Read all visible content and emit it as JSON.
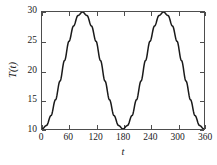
{
  "chart_data": {
    "type": "line",
    "title": "",
    "subtitle": "",
    "xlabel": "t",
    "ylabel": "T(t)",
    "xlim": [
      0,
      360
    ],
    "ylim": [
      10,
      30
    ],
    "xticks": [
      0,
      60,
      120,
      180,
      240,
      300,
      360
    ],
    "xticklabels": [
      "0",
      "60",
      "120",
      "180",
      "240",
      "300",
      "360"
    ],
    "yticks": [
      10,
      15,
      20,
      25,
      30
    ],
    "yticklabels": [
      "10",
      "15",
      "20",
      "25",
      "30"
    ],
    "grid": false,
    "legend": null,
    "frame": "box",
    "tick_direction": "in",
    "line_color": "#1a1a1a",
    "line_width": 1.5,
    "axis_color": "#4d4d4d",
    "background_color": "#ffffff",
    "series": [
      {
        "name": "T(t)",
        "formula": "T(t) = 20 - 10*cos(2t)",
        "x": [
          0,
          10,
          20,
          30,
          40,
          50,
          60,
          70,
          80,
          90,
          100,
          110,
          120,
          130,
          140,
          150,
          160,
          170,
          180,
          190,
          200,
          210,
          220,
          230,
          240,
          250,
          260,
          270,
          280,
          290,
          300,
          310,
          320,
          330,
          340,
          350,
          360
        ],
        "values": [
          10.0,
          10.6,
          12.3,
          15.0,
          18.2,
          21.7,
          25.0,
          27.6,
          29.4,
          30.0,
          29.4,
          27.6,
          25.0,
          21.7,
          18.2,
          15.0,
          12.3,
          10.6,
          10.0,
          10.6,
          12.3,
          15.0,
          18.2,
          21.7,
          25.0,
          27.6,
          29.4,
          30.0,
          29.4,
          27.6,
          25.0,
          21.7,
          18.2,
          15.0,
          12.3,
          10.6,
          10.0
        ]
      }
    ],
    "annotations": [
      {
        "label": "maximum",
        "x": 90,
        "y": 30
      },
      {
        "label": "maximum",
        "x": 270,
        "y": 30
      },
      {
        "label": "minimum",
        "x": 0,
        "y": 10
      },
      {
        "label": "minimum",
        "x": 180,
        "y": 10
      },
      {
        "label": "minimum",
        "x": 360,
        "y": 10
      }
    ]
  }
}
